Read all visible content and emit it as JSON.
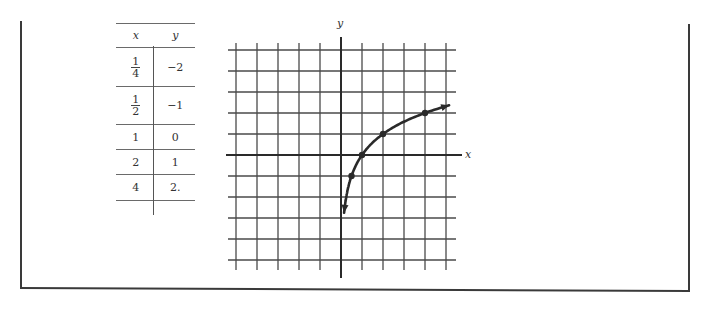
{
  "table": {
    "headers": [
      "x",
      "y"
    ],
    "rows": [
      {
        "x_num": "1",
        "x_den": "4",
        "y": "−2",
        "fraction": true,
        "height": 38
      },
      {
        "x_num": "1",
        "x_den": "2",
        "y": "−1",
        "fraction": true,
        "height": 37
      },
      {
        "x": "1",
        "y": "0",
        "fraction": false,
        "height": 24
      },
      {
        "x": "2",
        "y": "1",
        "fraction": false,
        "height": 24
      },
      {
        "x": "4",
        "y": "2.",
        "fraction": false,
        "height": 25
      }
    ]
  },
  "axes": {
    "x_label": "x",
    "y_label": "y"
  },
  "colors": {
    "ink": "#2a2a2a",
    "grid": "#4a4a4a",
    "frame": "#3a3a3a"
  },
  "chart_data": {
    "type": "line",
    "title": "",
    "function": "y = log2(x)",
    "xlabel": "x",
    "ylabel": "y",
    "xlim": [
      -5,
      5
    ],
    "ylim": [
      -5,
      5
    ],
    "grid": true,
    "grid_step": 1,
    "table_points": [
      {
        "x": 0.25,
        "y": -2
      },
      {
        "x": 0.5,
        "y": -1
      },
      {
        "x": 1,
        "y": 0
      },
      {
        "x": 2,
        "y": 1
      },
      {
        "x": 4,
        "y": 2
      }
    ],
    "plotted_points": [
      {
        "x": 0.5,
        "y": -1
      },
      {
        "x": 1,
        "y": 0
      },
      {
        "x": 2,
        "y": 1
      },
      {
        "x": 4,
        "y": 2
      }
    ],
    "curve_arrows": [
      "down-near-y-axis",
      "right-increasing"
    ]
  }
}
